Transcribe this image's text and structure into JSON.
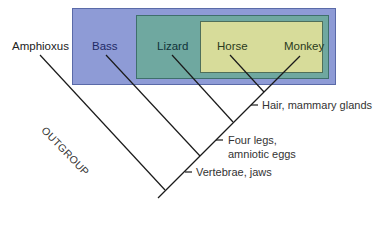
{
  "diagram": {
    "type": "cladogram",
    "taxa": [
      {
        "name": "Amphioxus",
        "group": "outgroup"
      },
      {
        "name": "Bass",
        "group": "vertebrates"
      },
      {
        "name": "Lizard",
        "group": "amniotes"
      },
      {
        "name": "Horse",
        "group": "mammals"
      },
      {
        "name": "Monkey",
        "group": "mammals"
      }
    ],
    "outgroup_label": "OUTGROUP",
    "traits": [
      {
        "label": "Vertebrae, jaws"
      },
      {
        "label_line1": "Four legs,",
        "label_line2": "amniotic eggs"
      },
      {
        "label": "Hair, mammary glands"
      }
    ],
    "colors": {
      "outer_box": "#8e9bd6",
      "middle_box": "#6fa8a0",
      "inner_box": "#d7dc9a",
      "lines": "#1a1a1a"
    }
  }
}
